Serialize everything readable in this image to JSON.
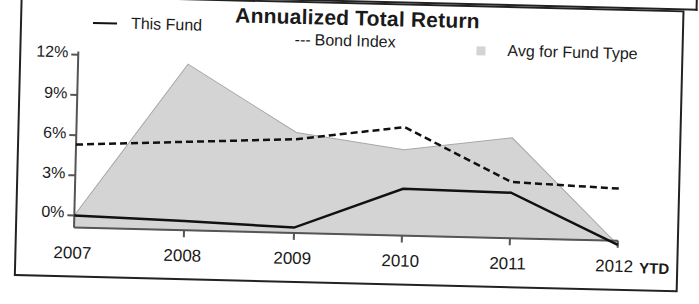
{
  "chart_data": {
    "type": "line",
    "title": "Annualized Total Return",
    "xlabel": "",
    "ylabel": "",
    "categories": [
      "2007",
      "2008",
      "2009",
      "2010",
      "2011",
      "2012"
    ],
    "x_suffix_label": "YTD",
    "yticks": [
      "12%",
      "9%",
      "6%",
      "3%",
      "0%"
    ],
    "ylim": [
      0,
      12
    ],
    "grid": false,
    "legend_position": "top",
    "series": [
      {
        "name": "This Fund",
        "style": "solid line",
        "values": [
          0.0,
          -0.2,
          -0.5,
          2.6,
          2.5,
          -1.2
        ]
      },
      {
        "name": "Bond Index",
        "style": "dashed line",
        "values": [
          5.3,
          5.7,
          6.1,
          7.2,
          3.3,
          3.0
        ]
      },
      {
        "name": "Avg for Fund Type",
        "style": "shaded area",
        "values": [
          0.0,
          11.5,
          6.6,
          5.5,
          6.6,
          -1.2
        ]
      }
    ]
  },
  "legend": {
    "this_fund": "This Fund",
    "bond_dash": "---",
    "bond_index": "Bond Index",
    "avg_fund_type": "Avg for Fund Type"
  },
  "axis": {
    "y": [
      "12%",
      "9%",
      "6%",
      "3%",
      "0%"
    ],
    "x": [
      "2007",
      "2008",
      "2009",
      "2010",
      "2011",
      "2012"
    ],
    "x_suffix": "YTD"
  },
  "colors": {
    "line": "#111111",
    "area_fill": "#d4d4d4",
    "area_edge": "#a8a8a8",
    "frame": "#222222"
  }
}
